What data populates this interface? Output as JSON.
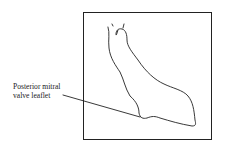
{
  "figure": {
    "labels": {
      "line1": "Posterior mitral",
      "line2": "valve leaflet"
    },
    "colors": {
      "ink": "#222222",
      "background": "#ffffff"
    }
  }
}
